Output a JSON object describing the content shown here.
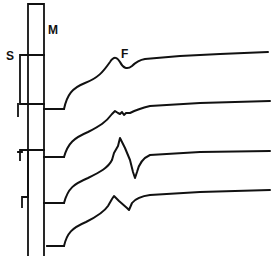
{
  "figure": {
    "type": "electrophysiology-trace-diagram",
    "background": "#ffffff",
    "ink_color": "#111111",
    "labels": {
      "s": "S",
      "m": "M",
      "f": "F"
    },
    "markers": {
      "m_bracket": "M 28 4 L 44 4 L 44 256 M 28 4 L 28 256",
      "m_rungs": "M 28 55 L 44 55 M 28 104 L 44 104 M 28 150 L 44 150",
      "s_bracket_top": "M 20 55 L 20 104 L 28 104 M 20 55 L 28 55",
      "s_tick_top": "M 18 104 L 18 116",
      "s_tick_mid": "M 20 150 L 28 150 M 20 150 L 20 160 M 18 152 L 22 152",
      "s_tick_low": "M 28 150 L 28 197 L 22 197 L 22 207",
      "m_baselines": "M 44 109 L 64 109 M 44 157 L 64 157 M 44 203 L 64 203 M 47 246 L 64 246"
    },
    "traces": [
      {
        "name": "trace-1",
        "path": "M 64 109 C 67 95, 72 88, 85 83 C 98 78, 103 72, 110 62 C 114 56, 117 57, 120 62 C 123 68, 127 70, 132 66 C 136 62, 139 60, 145 59 L 180 56 L 220 54 L 268 52"
      },
      {
        "name": "trace-2",
        "path": "M 64 157 C 68 143, 74 138, 88 132 C 100 126, 106 122, 112 114 L 115 111 L 118 113 L 120 114 L 122 112 L 124 115 L 126 113 L 130 113 C 136 110, 142 108, 150 106 L 200 103 L 270 101"
      },
      {
        "name": "trace-3",
        "path": "M 64 203 C 68 188, 74 184, 88 178 C 100 172, 108 168, 112 160 L 114 153 L 118 146 L 120 138 L 125 148 L 130 160 L 133 172 L 135 178 L 137 172 C 139 164, 143 158, 150 155 L 200 152 L 270 151"
      },
      {
        "name": "trace-4",
        "path": "M 64 246 C 67 233, 72 228, 86 222 C 98 216, 104 212, 108 206 L 112 199 L 114 196 L 119 201 L 127 208 L 129 210 L 132 203 C 136 198, 142 196, 150 195 L 200 192 L 270 190"
      }
    ]
  }
}
